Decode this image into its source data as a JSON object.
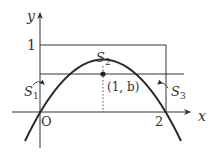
{
  "diagram": {
    "type": "function-graph",
    "function": "y = x(2 - x)",
    "axes": {
      "x_label": "x",
      "y_label": "y",
      "origin_label": "O",
      "x_tick_label": "2",
      "y_tick_label": "1"
    },
    "point": {
      "label": "(1, b)"
    },
    "regions": [
      {
        "name": "S1",
        "label_main": "S",
        "label_sub": "1"
      },
      {
        "name": "S2",
        "label_main": "S",
        "label_sub": "2"
      },
      {
        "name": "S3",
        "label_main": "S",
        "label_sub": "3"
      }
    ],
    "colors": {
      "stroke": "#333333",
      "curve": "#2a2a2a"
    }
  }
}
